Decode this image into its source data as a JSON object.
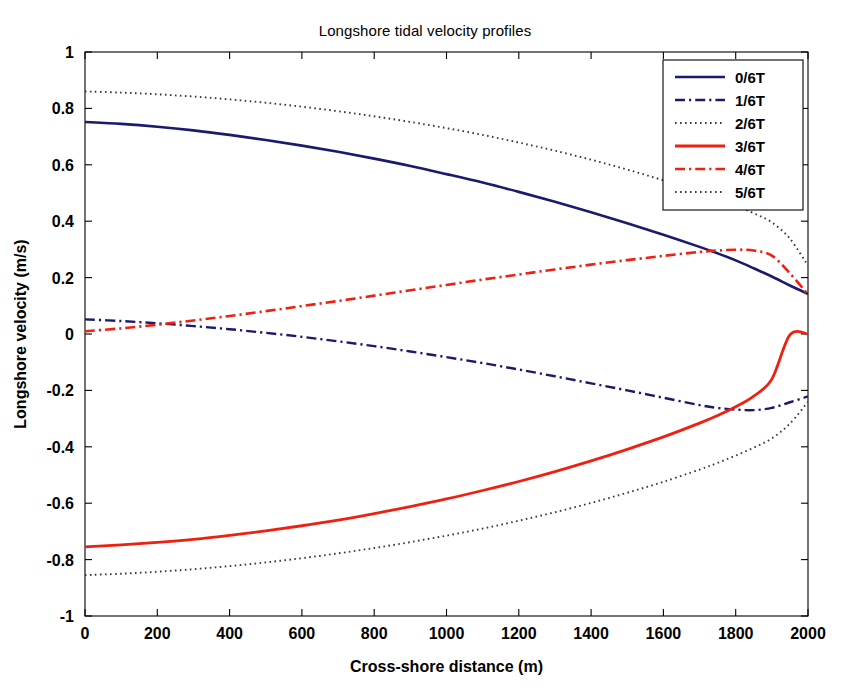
{
  "chart_data": {
    "type": "line",
    "title": "Longshore tidal velocity profiles",
    "xlabel": "Cross-shore distance (m)",
    "ylabel": "Longshore velocity (m/s)",
    "xlim": [
      0,
      2000
    ],
    "ylim": [
      -1,
      1
    ],
    "xticks": [
      0,
      200,
      400,
      600,
      800,
      1000,
      1200,
      1400,
      1600,
      1800,
      2000
    ],
    "xtick_labels": [
      "0",
      "200",
      "400",
      "600",
      "800",
      "1000",
      "1200",
      "1400",
      "1600",
      "1800",
      "2000"
    ],
    "yticks": [
      -1,
      -0.8,
      -0.6,
      -0.4,
      -0.2,
      0,
      0.2,
      0.4,
      0.6,
      0.8,
      1
    ],
    "ytick_labels": [
      "-1",
      "-0.8",
      "-0.6",
      "-0.4",
      "-0.2",
      "0",
      "0.2",
      "0.4",
      "0.6",
      "0.8",
      "1"
    ],
    "grid": false,
    "legend_position": "upper right",
    "x": [
      0,
      100,
      200,
      300,
      400,
      500,
      600,
      700,
      800,
      900,
      1000,
      1100,
      1200,
      1300,
      1400,
      1500,
      1600,
      1700,
      1750,
      1800,
      1850,
      1900,
      1950,
      2000
    ],
    "series": [
      {
        "name": "0/6T",
        "color": "#1a1a6e",
        "style": "solid",
        "width": 2.6,
        "values": [
          0.752,
          0.745,
          0.735,
          0.722,
          0.706,
          0.688,
          0.668,
          0.646,
          0.622,
          0.596,
          0.567,
          0.537,
          0.504,
          0.469,
          0.432,
          0.393,
          0.352,
          0.309,
          0.286,
          0.261,
          0.233,
          0.204,
          0.172,
          0.142
        ]
      },
      {
        "name": "1/6T",
        "color": "#1a1a6e",
        "style": "dashdot",
        "width": 2.4,
        "values": [
          0.052,
          0.046,
          0.038,
          0.028,
          0.017,
          0.004,
          -0.01,
          -0.026,
          -0.043,
          -0.062,
          -0.082,
          -0.103,
          -0.126,
          -0.15,
          -0.175,
          -0.2,
          -0.226,
          -0.252,
          -0.262,
          -0.268,
          -0.27,
          -0.262,
          -0.242,
          -0.221
        ]
      },
      {
        "name": "2/6T",
        "color": "#3a3a3a",
        "style": "dotted",
        "width": 1.9,
        "values": [
          0.86,
          0.856,
          0.85,
          0.842,
          0.832,
          0.82,
          0.806,
          0.79,
          0.772,
          0.752,
          0.73,
          0.706,
          0.679,
          0.65,
          0.618,
          0.583,
          0.545,
          0.503,
          0.48,
          0.455,
          0.428,
          0.396,
          0.338,
          0.242
        ]
      },
      {
        "name": "3/6T",
        "color": "#f02010",
        "style": "solid",
        "width": 2.8,
        "values": [
          -0.755,
          -0.748,
          -0.739,
          -0.728,
          -0.714,
          -0.698,
          -0.68,
          -0.66,
          -0.637,
          -0.612,
          -0.585,
          -0.555,
          -0.523,
          -0.488,
          -0.45,
          -0.409,
          -0.365,
          -0.316,
          -0.289,
          -0.258,
          -0.22,
          -0.16,
          -0.003,
          0.0
        ]
      },
      {
        "name": "4/6T",
        "color": "#f02010",
        "style": "dashdot",
        "width": 2.6,
        "values": [
          0.01,
          0.02,
          0.033,
          0.048,
          0.064,
          0.081,
          0.099,
          0.117,
          0.136,
          0.155,
          0.174,
          0.193,
          0.211,
          0.229,
          0.246,
          0.262,
          0.277,
          0.291,
          0.296,
          0.299,
          0.296,
          0.278,
          0.215,
          0.14
        ]
      },
      {
        "name": "5/6T",
        "color": "#3a3a3a",
        "style": "dotted",
        "width": 1.9,
        "values": [
          -0.855,
          -0.85,
          -0.843,
          -0.834,
          -0.823,
          -0.81,
          -0.795,
          -0.778,
          -0.759,
          -0.738,
          -0.715,
          -0.69,
          -0.662,
          -0.632,
          -0.599,
          -0.563,
          -0.524,
          -0.481,
          -0.457,
          -0.431,
          -0.403,
          -0.37,
          -0.318,
          -0.24
        ]
      }
    ]
  },
  "legend": {
    "entries": [
      {
        "label": "0/6T"
      },
      {
        "label": "1/6T"
      },
      {
        "label": "2/6T"
      },
      {
        "label": "3/6T"
      },
      {
        "label": "4/6T"
      },
      {
        "label": "5/6T"
      }
    ]
  }
}
